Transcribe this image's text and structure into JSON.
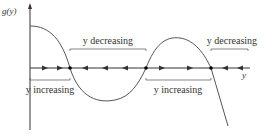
{
  "diagram": {
    "y_axis_label": "g(y)",
    "x_axis_label": "y",
    "labels": {
      "decreasing_left": "y decreasing",
      "decreasing_right": "y decreasing",
      "increasing_left": "y increasing",
      "increasing_right": "y increasing"
    },
    "equilibria_count": 2,
    "flow": [
      "right",
      "right",
      "left",
      "left",
      "left",
      "right",
      "right",
      "left",
      "left"
    ],
    "colors": {
      "ink": "#333333",
      "curve": "#555555"
    }
  }
}
